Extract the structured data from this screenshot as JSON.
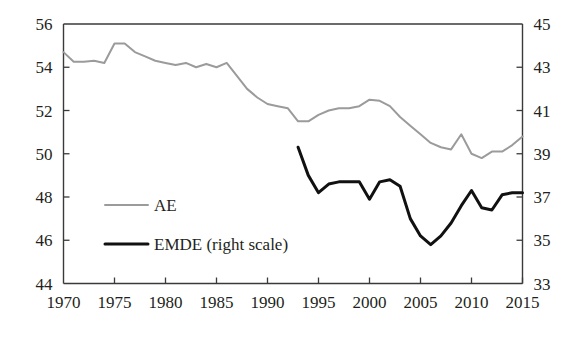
{
  "chart_data": {
    "type": "line",
    "title": "",
    "subtitle": "",
    "xlabel": "",
    "ylabel": "",
    "y2label": "",
    "grid": false,
    "legend_position": "center-left-inside",
    "xlim": [
      1970,
      2015
    ],
    "ylim": [
      44,
      56
    ],
    "y2lim": [
      33,
      45
    ],
    "x_ticks": [
      1970,
      1975,
      1980,
      1985,
      1990,
      1995,
      2000,
      2005,
      2010,
      2015
    ],
    "x_tick_labels": [
      "1970",
      "1975",
      "1980",
      "1985",
      "1990",
      "1995",
      "2000",
      "2005",
      "2010",
      "2015"
    ],
    "y_ticks": [
      44,
      46,
      48,
      50,
      52,
      54,
      56
    ],
    "y_tick_labels": [
      "44",
      "46",
      "48",
      "50",
      "52",
      "54",
      "56"
    ],
    "y2_ticks": [
      33,
      35,
      37,
      39,
      41,
      43,
      45
    ],
    "y2_tick_labels": [
      "33",
      "35",
      "37",
      "39",
      "41",
      "43",
      "45"
    ],
    "series": [
      {
        "name": "AE",
        "legend_label": "AE",
        "axis": "left",
        "color": "#9b9b9b",
        "line_width": 2.0,
        "x": [
          1970,
          1971,
          1972,
          1973,
          1974,
          1975,
          1976,
          1977,
          1978,
          1979,
          1980,
          1981,
          1982,
          1983,
          1984,
          1985,
          1986,
          1987,
          1988,
          1989,
          1990,
          1991,
          1992,
          1993,
          1994,
          1995,
          1996,
          1997,
          1998,
          1999,
          2000,
          2001,
          2002,
          2003,
          2004,
          2005,
          2006,
          2007,
          2008,
          2009,
          2010,
          2011,
          2012,
          2013,
          2014,
          2015
        ],
        "values": [
          54.7,
          54.25,
          54.25,
          54.3,
          54.2,
          55.1,
          55.1,
          54.7,
          54.5,
          54.3,
          54.2,
          54.1,
          54.2,
          54.0,
          54.15,
          54.0,
          54.2,
          53.6,
          53.0,
          52.6,
          52.3,
          52.2,
          52.1,
          51.5,
          51.5,
          51.8,
          52.0,
          52.1,
          52.1,
          52.2,
          52.5,
          52.45,
          52.2,
          51.7,
          51.3,
          50.9,
          50.5,
          50.3,
          50.2,
          50.9,
          50.0,
          49.8,
          50.1,
          50.1,
          50.4,
          50.8
        ]
      },
      {
        "name": "EMDE",
        "legend_label": "EMDE (right scale)",
        "axis": "right",
        "color": "#111111",
        "line_width": 3.0,
        "x": [
          1993,
          1994,
          1995,
          1996,
          1997,
          1998,
          1999,
          2000,
          2001,
          2002,
          2003,
          2004,
          2005,
          2006,
          2007,
          2008,
          2009,
          2010,
          2011,
          2012,
          2013,
          2014,
          2015
        ],
        "values": [
          39.3,
          38.0,
          37.2,
          37.6,
          37.7,
          37.7,
          37.7,
          36.9,
          37.7,
          37.8,
          37.5,
          36.0,
          35.2,
          34.8,
          35.2,
          35.8,
          36.6,
          37.3,
          36.5,
          36.4,
          37.1,
          37.2,
          37.2
        ]
      }
    ],
    "annotations": []
  },
  "legend": {
    "entries": [
      {
        "label": "AE",
        "color": "#9b9b9b"
      },
      {
        "label": "EMDE (right scale)",
        "color": "#111111"
      }
    ]
  },
  "axes": {
    "left_tick_labels": [
      "56",
      "54",
      "52",
      "50",
      "48",
      "46",
      "44"
    ],
    "right_tick_labels": [
      "45",
      "43",
      "41",
      "39",
      "37",
      "35",
      "33"
    ],
    "x_tick_labels": [
      "1970",
      "1975",
      "1980",
      "1985",
      "1990",
      "1995",
      "2000",
      "2005",
      "2010",
      "2015"
    ]
  },
  "colors": {
    "ae_line": "#9b9b9b",
    "emde_line": "#111111",
    "axis": "#3a3a3a",
    "text": "#231f20",
    "background": "#ffffff"
  }
}
